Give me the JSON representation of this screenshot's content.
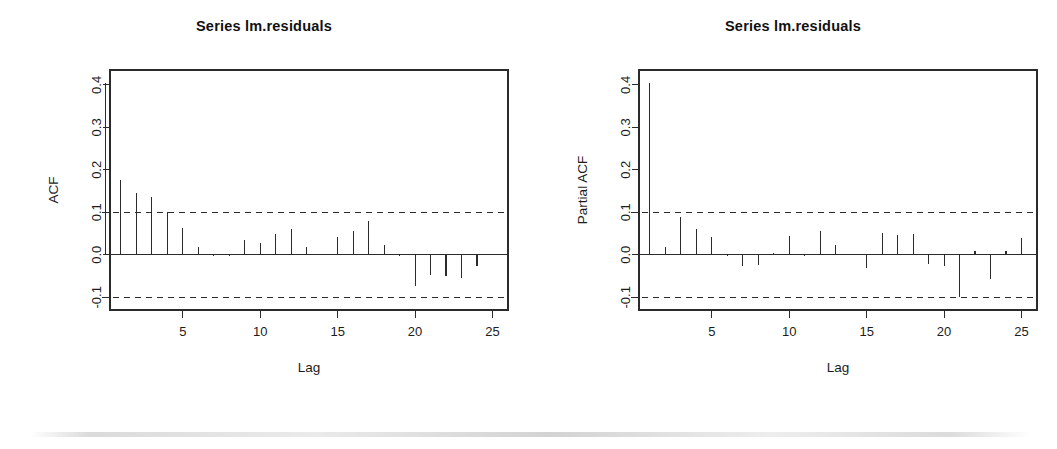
{
  "figure": {
    "background": "#ffffff",
    "foreground": "#2b2b2b",
    "width": 1057,
    "height": 449,
    "artifact_note": "faint horizontal scan line near bottom edge"
  },
  "panels": [
    {
      "id": "acf",
      "title": "Series  lm.residuals"
    },
    {
      "id": "pacf",
      "title": "Series  lm.residuals"
    }
  ],
  "chart_data": [
    {
      "type": "bar",
      "id": "acf",
      "title": "Series  lm.residuals",
      "xlabel": "Lag",
      "ylabel": "ACF",
      "x": [
        0,
        1,
        2,
        3,
        4,
        5,
        6,
        7,
        8,
        9,
        10,
        11,
        12,
        13,
        14,
        15,
        16,
        17,
        18,
        19,
        20,
        21,
        22,
        23,
        24,
        25
      ],
      "values": [
        0.405,
        0.175,
        0.145,
        0.137,
        0.101,
        0.063,
        0.019,
        -0.004,
        -0.003,
        0.035,
        0.028,
        0.049,
        0.06,
        0.018,
        0.002,
        0.042,
        0.056,
        0.079,
        0.024,
        -0.002,
        -0.073,
        -0.048,
        -0.05,
        -0.054,
        -0.027
      ],
      "categories": [
        "1",
        "2",
        "3",
        "4",
        "5",
        "6",
        "7",
        "8",
        "9",
        "10",
        "11",
        "12",
        "13",
        "14",
        "15",
        "16",
        "17",
        "18",
        "19",
        "20",
        "21",
        "22",
        "23",
        "24",
        "25"
      ],
      "xticks": [
        5,
        10,
        15,
        20,
        25
      ],
      "xticklabels": [
        "5",
        "10",
        "15",
        "20",
        "25"
      ],
      "yticks": [
        -0.1,
        0.0,
        0.1,
        0.2,
        0.3,
        0.4
      ],
      "yticklabels": [
        "-0.1",
        "0.0",
        "0.1",
        "0.2",
        "0.3",
        "0.4"
      ],
      "xlim": [
        0.3,
        26.0
      ],
      "ylim": [
        -0.13,
        0.435
      ],
      "confidence_bounds": [
        0.1,
        -0.1
      ],
      "confidence_style": "dashed",
      "zero_line": 0.0,
      "grid": false,
      "legend": null
    },
    {
      "type": "bar",
      "id": "pacf",
      "title": "Series  lm.residuals",
      "xlabel": "Lag",
      "ylabel": "Partial ACF",
      "x": [
        1,
        2,
        3,
        4,
        5,
        6,
        7,
        8,
        9,
        10,
        11,
        12,
        13,
        14,
        15,
        16,
        17,
        18,
        19,
        20,
        21,
        22,
        23,
        24,
        25
      ],
      "values": [
        0.405,
        0.018,
        0.09,
        0.06,
        0.042,
        -0.003,
        -0.027,
        -0.024,
        0.004,
        0.045,
        -0.002,
        0.055,
        0.022,
        -0.001,
        -0.03,
        0.052,
        0.047,
        0.05,
        -0.021,
        -0.026,
        -0.099,
        0.008,
        -0.056,
        0.009,
        0.039
      ],
      "categories": [
        "1",
        "2",
        "3",
        "4",
        "5",
        "6",
        "7",
        "8",
        "9",
        "10",
        "11",
        "12",
        "13",
        "14",
        "15",
        "16",
        "17",
        "18",
        "19",
        "20",
        "21",
        "22",
        "23",
        "24",
        "25"
      ],
      "xticks": [
        5,
        10,
        15,
        20,
        25
      ],
      "xticklabels": [
        "5",
        "10",
        "15",
        "20",
        "25"
      ],
      "yticks": [
        -0.1,
        0.0,
        0.1,
        0.2,
        0.3,
        0.4
      ],
      "yticklabels": [
        "-0.1",
        "0.0",
        "0.1",
        "0.2",
        "0.3",
        "0.4"
      ],
      "xlim": [
        0.3,
        26.0
      ],
      "ylim": [
        -0.13,
        0.435
      ],
      "confidence_bounds": [
        0.1,
        -0.1
      ],
      "confidence_style": "dashed",
      "zero_line": 0.0,
      "grid": false,
      "legend": null
    }
  ]
}
